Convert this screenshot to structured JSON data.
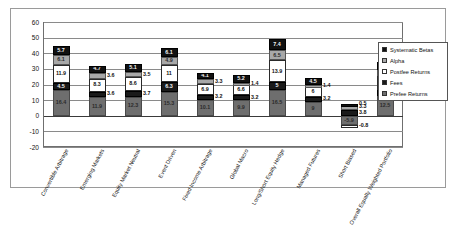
{
  "chart_data": {
    "type": "bar",
    "title": "",
    "xlabel": "",
    "ylabel": "",
    "stacked": true,
    "grid": true,
    "legend_position": "right",
    "ylim": [
      -20,
      60
    ],
    "yticks": [
      -20,
      -10,
      0,
      10,
      20,
      30,
      40,
      50,
      60
    ],
    "categories": [
      "Convertible Arbitrage",
      "Emerging Markets",
      "Equity Market Neutral",
      "Event Driven",
      "Fixed Income Arbitrage",
      "Global Macro",
      "Long/Short Equity Hedge",
      "Managed Futures",
      "Short Biased",
      "Overall Equally Weighted Portfolio"
    ],
    "series": [
      {
        "name": "Prefee Returns",
        "values": [
          16.4,
          11.9,
          12.3,
          15.3,
          10.1,
          9.9,
          16.5,
          9.0,
          -5.9,
          12.5
        ]
      },
      {
        "name": "Fees",
        "values": [
          4.5,
          3.6,
          3.7,
          6.3,
          3.2,
          3.2,
          5.0,
          3.2,
          3.8,
          3.8
        ]
      },
      {
        "name": "Postfee Returns",
        "values": [
          11.9,
          8.3,
          8.6,
          11.0,
          6.9,
          6.6,
          13.9,
          6.0,
          -0.8,
          9.1
        ]
      },
      {
        "name": "Alpha",
        "values": [
          6.1,
          3.6,
          3.5,
          4.9,
          3.3,
          1.4,
          6.5,
          1.4,
          3.3,
          3.7
        ]
      },
      {
        "name": "Systematic Betas",
        "values": [
          5.7,
          4.7,
          5.1,
          6.1,
          4.1,
          5.2,
          7.4,
          4.5,
          0.5,
          5.4
        ]
      }
    ],
    "legend_entries": [
      "Systematic Betas",
      "Alpha",
      "Postfee Returns",
      "Fees",
      "Prefee Returns"
    ],
    "colors": {
      "systematic_betas": "#111111",
      "alpha": "#a8a8a8",
      "postfee_returns": "#ffffff",
      "fees": "#1a1a1a",
      "prefee_returns": "#6e6e6e",
      "grid": "#8a8a8a",
      "frame": "#6f6f6f"
    },
    "bar_value_labels": {
      "bar0": [
        "16.4",
        "4.5",
        "11.9",
        "6.1",
        "5.7"
      ],
      "bar1": [
        "11.9",
        "3.6",
        "8.3",
        "3.6",
        "4.7"
      ],
      "bar2": [
        "12.3",
        "3.7",
        "8.6",
        "3.5",
        "5.1"
      ],
      "bar3": [
        "15.3",
        "6.3",
        "11",
        "4.9",
        "6.1"
      ],
      "bar4": [
        "10.1",
        "3.2",
        "6.9",
        "3.3",
        "4.1"
      ],
      "bar5": [
        "9.9",
        "3.2",
        "6.6",
        "1.4",
        "5.2"
      ],
      "bar6": [
        "16.5",
        "5",
        "13.9",
        "6.5",
        "7.4"
      ],
      "bar7": [
        "9",
        "3.2",
        "6",
        "1.4",
        "4.5"
      ],
      "bar8": [
        "-5.9",
        "3.8",
        "-0.8",
        "3.3",
        "0.5"
      ],
      "bar9": [
        "12.5",
        "3.8",
        "9.1",
        "3.7",
        "5.4"
      ]
    },
    "outside_labels": [
      {
        "text": "1.4",
        "bar": 5,
        "series": "Alpha"
      },
      {
        "text": "1.4",
        "bar": 7,
        "series": "Alpha"
      },
      {
        "text": "-0.8",
        "bar": 8,
        "series": "Postfee Returns"
      },
      {
        "text": "0.5",
        "bar": 8,
        "series": "Systematic Betas"
      },
      {
        "text": "3.3",
        "bar": 8,
        "series": "Alpha"
      }
    ]
  }
}
